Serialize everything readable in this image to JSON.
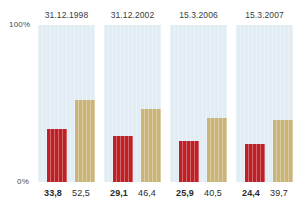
{
  "chart_data": {
    "type": "bar",
    "title": "",
    "subtitle": "",
    "xlabel": "",
    "ylabel": "",
    "categories": [
      "31.12.1998",
      "31.12.2002",
      "15.3.2006",
      "15.3.2007"
    ],
    "series": [
      {
        "name": "primary",
        "color": "#be2026",
        "values": [
          33.8,
          29.1,
          25.9,
          24.4
        ]
      },
      {
        "name": "secondary",
        "color": "#cbb478",
        "values": [
          52.5,
          46.4,
          40.5,
          39.7
        ]
      }
    ],
    "value_labels": [
      {
        "primary": "33,8",
        "secondary": "52,5"
      },
      {
        "primary": "29,1",
        "secondary": "46,4"
      },
      {
        "primary": "25,9",
        "secondary": "40,5"
      },
      {
        "primary": "24,4",
        "secondary": "39,7"
      }
    ],
    "ylim": [
      0,
      100
    ],
    "ytick_labels": [
      "0%",
      "100%"
    ],
    "grid": false,
    "legend": "none",
    "panel_color": "#e1edf4"
  },
  "axis": {
    "top_label": "100%",
    "bottom_label": "0%"
  }
}
